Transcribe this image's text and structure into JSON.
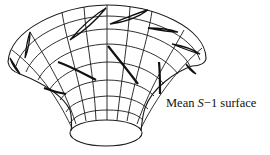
{
  "figure": {
    "label": {
      "prefix": "Mean ",
      "variable": "S",
      "suffix": "−1 surface"
    },
    "colors": {
      "ink": "#111111",
      "background": "#ffffff"
    }
  }
}
